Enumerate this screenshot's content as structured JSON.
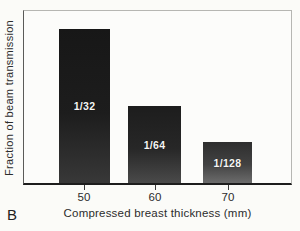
{
  "panel_label": "B",
  "chart_data": {
    "type": "bar",
    "title": "",
    "xlabel": "Compressed breast thickness (mm)",
    "ylabel": "Fraction of beam transmission",
    "categories": [
      "50",
      "60",
      "70"
    ],
    "values": [
      0.03125,
      0.015625,
      0.0078125
    ],
    "bar_labels": [
      "1/32",
      "1/64",
      "1/128"
    ],
    "ylim": [
      0,
      0.035
    ],
    "y_axis_ticks": [],
    "grid": false,
    "legend": "none",
    "colors": {
      "bar_top": "#171717",
      "bar_bottom": "#6c6c6c",
      "bar_label_text": "#f6f6f4",
      "axis_line": "#1d1d1d",
      "frame_light": "#b6b6b2",
      "text": "#2c2c2c",
      "background": "#fbfbf8"
    }
  }
}
